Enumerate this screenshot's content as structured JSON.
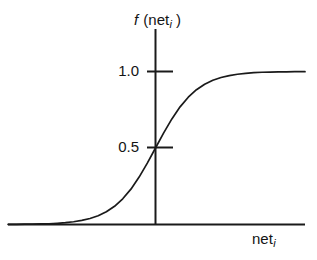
{
  "figure": {
    "background_color": "#ffffff",
    "ink_color": "#1a1a1a"
  },
  "axes": {
    "y_axis_label_prefix": "f",
    "y_axis_label_open": " (net",
    "y_axis_label_sub": "i",
    "y_axis_label_close": " )",
    "x_axis_label_main": "net",
    "x_axis_label_sub": "i",
    "y_tick_labels": [
      "1.0",
      "0.5"
    ]
  },
  "chart_data": {
    "type": "line",
    "title": "",
    "subtitle": "",
    "xlabel": "net_i",
    "ylabel": "f (net_i)",
    "grid": false,
    "legend": null,
    "xlim": [
      -7.2,
      7.3
    ],
    "ylim": [
      0,
      1.09
    ],
    "x_ticks": [],
    "x_tick_labels": [],
    "y_ticks": [
      0.5,
      1.0
    ],
    "y_tick_labels": [
      "0.5",
      "1.0"
    ],
    "annotations": [],
    "series": [
      {
        "name": "logistic sigmoid",
        "formula": "f(net_i) = 1 / (1 + exp(-net_i))",
        "x": [
          -7.2,
          -6.8,
          -6.4,
          -6.0,
          -5.6,
          -5.2,
          -4.8,
          -4.4,
          -4.0,
          -3.6,
          -3.2,
          -2.8,
          -2.4,
          -2.0,
          -1.6,
          -1.2,
          -0.8,
          -0.4,
          0.0,
          0.4,
          0.8,
          1.2,
          1.6,
          2.0,
          2.4,
          2.8,
          3.2,
          3.6,
          4.0,
          4.4,
          4.8,
          5.2,
          5.6,
          6.0,
          6.4,
          6.8,
          7.3
        ],
        "values": [
          0.001,
          0.001,
          0.002,
          0.002,
          0.004,
          0.005,
          0.008,
          0.012,
          0.018,
          0.027,
          0.039,
          0.057,
          0.083,
          0.119,
          0.168,
          0.231,
          0.31,
          0.401,
          0.5,
          0.599,
          0.69,
          0.769,
          0.832,
          0.881,
          0.917,
          0.943,
          0.961,
          0.973,
          0.982,
          0.988,
          0.992,
          0.995,
          0.996,
          0.998,
          0.998,
          0.999,
          0.999
        ]
      }
    ],
    "key_points": [
      {
        "x": 0.0,
        "y": 0.5,
        "label": "0.5"
      },
      {
        "x": null,
        "y": 1.0,
        "label": "1.0 (asymptote)"
      }
    ]
  }
}
